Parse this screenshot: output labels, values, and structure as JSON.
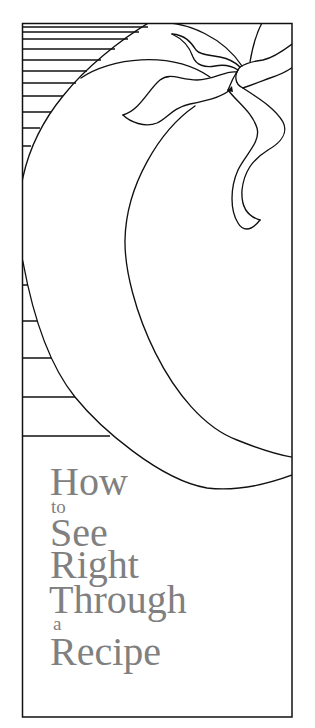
{
  "cover": {
    "title": "How to See Right Through a Recipe",
    "title_lines": [
      {
        "text": "How",
        "size": "large"
      },
      {
        "text": "to",
        "size": "small"
      },
      {
        "text": "See",
        "size": "large"
      },
      {
        "text": "Right",
        "size": "large"
      },
      {
        "text": "Through",
        "size": "large"
      },
      {
        "text": "a",
        "size": "small"
      },
      {
        "text": "Recipe",
        "size": "large"
      }
    ]
  },
  "illustration": {
    "subject": "tomato-with-leaves",
    "background_motif": "horizontal-stripes",
    "icons": [
      "tomato-icon",
      "leaf-icon",
      "stem-icon"
    ]
  },
  "colors": {
    "line_art": "#111111",
    "title_text": "#808080",
    "background": "#ffffff"
  }
}
